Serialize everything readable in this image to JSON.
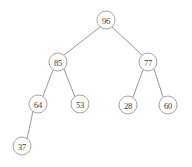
{
  "diagram": {
    "type": "binary-tree",
    "background_color": "#ffffff",
    "node_fill": "#ffffff",
    "node_stroke": "#9a9a9a",
    "edge_stroke": "#8a8a8a",
    "text_color": "#3a3a3a",
    "node_radius": 9
  },
  "chart_data": {
    "type": "diagram",
    "nodes": [
      {
        "id": "n96",
        "label": "96",
        "x": 106,
        "y": 20,
        "depth": 0,
        "parent": null,
        "side": "root"
      },
      {
        "id": "n85",
        "label": "85",
        "x": 58,
        "y": 62,
        "depth": 1,
        "parent": "n96",
        "side": "left"
      },
      {
        "id": "n77",
        "label": "77",
        "x": 148,
        "y": 62,
        "depth": 1,
        "parent": "n96",
        "side": "right"
      },
      {
        "id": "n64",
        "label": "64",
        "x": 38,
        "y": 104,
        "depth": 2,
        "parent": "n85",
        "side": "left"
      },
      {
        "id": "n53",
        "label": "53",
        "x": 80,
        "y": 104,
        "depth": 2,
        "parent": "n85",
        "side": "right"
      },
      {
        "id": "n28",
        "label": "28",
        "x": 128,
        "y": 105,
        "depth": 2,
        "parent": "n77",
        "side": "left"
      },
      {
        "id": "n60",
        "label": "60",
        "x": 168,
        "y": 105,
        "depth": 2,
        "parent": "n77",
        "side": "right"
      },
      {
        "id": "n37",
        "label": "37",
        "x": 22,
        "y": 146,
        "depth": 3,
        "parent": "n64",
        "side": "left"
      }
    ],
    "edges": [
      {
        "from": "n96",
        "to": "n85",
        "x1": 100,
        "y1": 27,
        "x2": 64,
        "y2": 55
      },
      {
        "from": "n96",
        "to": "n77",
        "x1": 112,
        "y1": 27,
        "x2": 142,
        "y2": 55
      },
      {
        "from": "n85",
        "to": "n64",
        "x1": 53,
        "y1": 70,
        "x2": 43,
        "y2": 96
      },
      {
        "from": "n85",
        "to": "n53",
        "x1": 64,
        "y1": 69,
        "x2": 75,
        "y2": 97
      },
      {
        "from": "n77",
        "to": "n28",
        "x1": 143,
        "y1": 70,
        "x2": 133,
        "y2": 97
      },
      {
        "from": "n77",
        "to": "n60",
        "x1": 154,
        "y1": 69,
        "x2": 163,
        "y2": 97
      },
      {
        "from": "n64",
        "to": "n37",
        "x1": 33,
        "y1": 111,
        "x2": 27,
        "y2": 139
      }
    ],
    "traversal_preorder": [
      "96",
      "85",
      "64",
      "37",
      "53",
      "77",
      "28",
      "60"
    ],
    "root_value": "96",
    "node_count": 8,
    "max_depth": 3
  }
}
